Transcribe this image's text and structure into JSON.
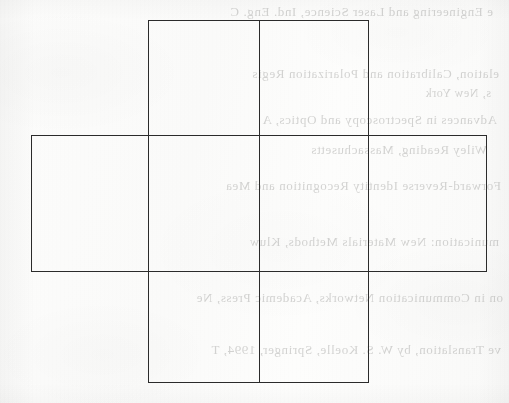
{
  "page": {
    "kind": "scanned-book-page-figure",
    "width": 509,
    "height": 403,
    "background_color": "#fbfbfa",
    "ink_color": "#2b2b2b"
  },
  "figure": {
    "name": "cube-net-diagram",
    "stroke_color": "#2b2b2b",
    "stroke_width_px": 1.4,
    "fill": "none",
    "shapes": [
      {
        "id": "vertical-bar",
        "label": "vertical-bar",
        "x": 148,
        "y": 20,
        "width": 221,
        "height": 363
      },
      {
        "id": "horizontal-bar",
        "label": "horizontal-bar",
        "x": 31,
        "y": 135,
        "width": 456,
        "height": 137
      }
    ],
    "dividers": [
      {
        "id": "center-vertical-divider",
        "label": "center-vertical-divider",
        "orientation": "vertical",
        "x": 259,
        "y": 20,
        "length": 363
      }
    ],
    "implied_faces": [
      "top-square",
      "left-rectangle",
      "front-left-square",
      "front-right-square",
      "right-rectangle",
      "bottom-square"
    ]
  },
  "bleed_through": {
    "note": "faint mirrored show-through text from the reverse side of the sheet",
    "color": "#9a9a98",
    "opacity": 0.42,
    "lines": [
      {
        "text": "e Engineering and Laser Science, Ind. Eng. C",
        "x": 16,
        "y": 4,
        "size": 13
      },
      {
        "text": "elation, Calibration and Polarization Regis",
        "x": 10,
        "y": 66,
        "size": 13
      },
      {
        "text": "s, New York",
        "x": 18,
        "y": 86,
        "size": 12
      },
      {
        "text": "Advances in Spectroscopy and Optics, A",
        "x": 12,
        "y": 112,
        "size": 13
      },
      {
        "text": "Wiley Reading, Massachusetts",
        "x": 22,
        "y": 142,
        "size": 13
      },
      {
        "text": "Forward-Reverse Identity Recognition and Mea",
        "x": 8,
        "y": 178,
        "size": 13
      },
      {
        "text": "munication: New Materials Methods, Kluw",
        "x": 10,
        "y": 234,
        "size": 13
      },
      {
        "text": "on in Communication Networks, Academic Press, Ne",
        "x": 6,
        "y": 290,
        "size": 13
      },
      {
        "text": "ve Translation, by W. S. Koelle, Springer, 1994, T",
        "x": 8,
        "y": 342,
        "size": 13
      }
    ]
  }
}
